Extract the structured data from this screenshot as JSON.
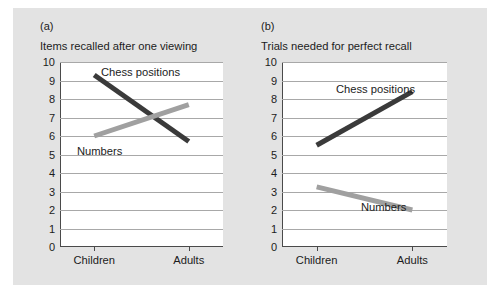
{
  "figure": {
    "background_color": "#e3e3e3",
    "panels": [
      {
        "letter": "(a)",
        "title": "Items recalled after one viewing"
      },
      {
        "letter": "(b)",
        "title": "Trials needed for perfect recall"
      }
    ]
  },
  "chart_data": [
    {
      "type": "line",
      "title": "Items recalled after one viewing",
      "panel": "(a)",
      "xlabel": "",
      "ylabel": "",
      "categories": [
        "Children",
        "Adults"
      ],
      "ylim": [
        0,
        10
      ],
      "yticks": [
        0,
        1,
        2,
        3,
        4,
        5,
        6,
        7,
        8,
        9,
        10
      ],
      "grid": true,
      "legend": "inline-labels",
      "series": [
        {
          "name": "Chess positions",
          "values": [
            9.3,
            5.7
          ],
          "color": "#3a3a3a"
        },
        {
          "name": "Numbers",
          "values": [
            6.0,
            7.7
          ],
          "color": "#a0a0a0"
        }
      ]
    },
    {
      "type": "line",
      "title": "Trials needed for perfect recall",
      "panel": "(b)",
      "xlabel": "",
      "ylabel": "",
      "categories": [
        "Children",
        "Adults"
      ],
      "ylim": [
        0,
        10
      ],
      "yticks": [
        0,
        1,
        2,
        3,
        4,
        5,
        6,
        7,
        8,
        9,
        10
      ],
      "grid": true,
      "legend": "inline-labels",
      "series": [
        {
          "name": "Chess positions",
          "values": [
            5.5,
            8.4
          ],
          "color": "#3a3a3a"
        },
        {
          "name": "Numbers",
          "values": [
            3.25,
            2.0
          ],
          "color": "#a0a0a0"
        }
      ]
    }
  ],
  "tick_labels": {
    "y": [
      "10",
      "9",
      "8",
      "7",
      "6",
      "5",
      "4",
      "3",
      "2",
      "1",
      "0"
    ],
    "x": [
      "Children",
      "Adults"
    ]
  }
}
